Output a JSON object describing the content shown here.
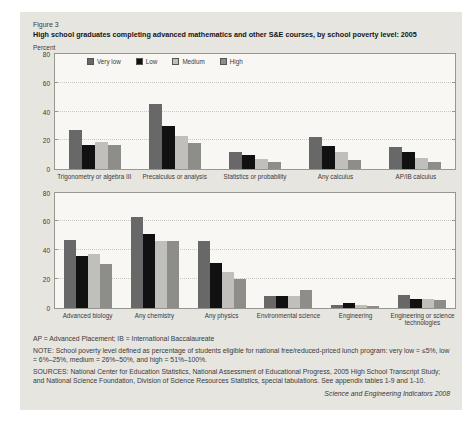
{
  "figure": {
    "label": "Figure 3",
    "title": "High school graduates completing advanced mathematics and other S&E courses, by school poverty level: 2005",
    "unit": "Percent"
  },
  "legend": {
    "position": "top-left-inside-upper-chart",
    "items": [
      {
        "label": "Very low",
        "color": "#686868"
      },
      {
        "label": "Low",
        "color": "#111111"
      },
      {
        "label": "Medium",
        "color": "#c0bfbc"
      },
      {
        "label": "High",
        "color": "#8d8d8a"
      }
    ]
  },
  "chart_data": [
    {
      "type": "bar",
      "panel": "advanced mathematics",
      "categories": [
        "Trigonometry or algebra III",
        "Precalculus or analysis",
        "Statistics or probability",
        "Any calculus",
        "AP/IB calculus"
      ],
      "series": [
        {
          "name": "Very low",
          "values": [
            27,
            45,
            12,
            22,
            15
          ]
        },
        {
          "name": "Low",
          "values": [
            17,
            30,
            10,
            16,
            12
          ]
        },
        {
          "name": "Medium",
          "values": [
            19,
            23,
            7,
            12,
            8
          ]
        },
        {
          "name": "High",
          "values": [
            17,
            18,
            5,
            6,
            5
          ]
        }
      ],
      "xlabel": "",
      "ylabel": "Percent",
      "ylim": [
        0,
        80
      ],
      "yticks": [
        0,
        20,
        40,
        60,
        80
      ],
      "grid": "horizontal-dotted",
      "legend_position": "top-left-inside"
    },
    {
      "type": "bar",
      "panel": "other S&E courses",
      "categories": [
        "Advanced biology",
        "Any chemistry",
        "Any physics",
        "Environmental science",
        "Engineering",
        "Engineering or science technologies"
      ],
      "series": [
        {
          "name": "Very low",
          "values": [
            47,
            63,
            46,
            8,
            2,
            9
          ]
        },
        {
          "name": "Low",
          "values": [
            36,
            51,
            31,
            8,
            3,
            6
          ]
        },
        {
          "name": "Medium",
          "values": [
            37,
            46,
            25,
            8,
            2,
            6
          ]
        },
        {
          "name": "High",
          "values": [
            30,
            46,
            20,
            12,
            1,
            5
          ]
        }
      ],
      "xlabel": "",
      "ylabel": "Percent",
      "ylim": [
        0,
        80
      ],
      "yticks": [
        0,
        20,
        40,
        60,
        80
      ],
      "grid": "horizontal-dotted",
      "legend_position": "none"
    }
  ],
  "footnotes": {
    "abbrev": "AP = Advanced Placement; IB = International Baccalaureate",
    "note": "NOTE: School poverty level defined as percentage of students eligible for national free/reduced-priced lunch program: very low = ≤5%, low = 6%–25%, medium = 26%–50%, and high = 51%–100%.",
    "sources": "SOURCES: National Center for Education Statistics, National Assessment of Educational Progress, 2005 High School Transcript Study; and National Science Foundation, Division of Science Resources Statistics, special tabulations. See appendix tables 1-9 and 1-10.",
    "attribution": "Science and Engineering Indicators 2008"
  },
  "colors": {
    "content_bg": "#e7e5e0",
    "plot_bg": "#f8f7f4",
    "plot_border": "#97968f",
    "gridline": "#c9c8c1"
  }
}
